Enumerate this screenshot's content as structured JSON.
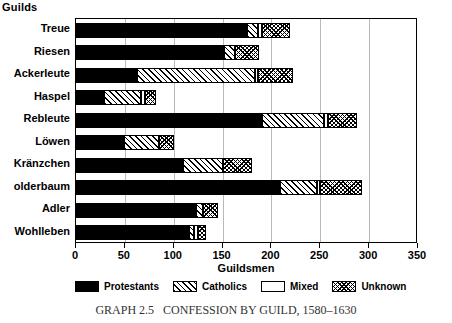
{
  "figure": {
    "corner_title": "Guilds",
    "caption": "GRAPH 2.5   CONFESSION BY GUILD, 1580–1630"
  },
  "legend": {
    "items": [
      {
        "label": "Protestants",
        "key": "protestants",
        "pattern": "solid-black"
      },
      {
        "label": "Catholics",
        "key": "catholics",
        "pattern": "diagonal-hatch"
      },
      {
        "label": "Mixed",
        "key": "mixed",
        "pattern": "white-empty"
      },
      {
        "label": "Unknown",
        "key": "unknown",
        "pattern": "cross-hatch"
      }
    ]
  },
  "chart_data": {
    "type": "bar",
    "orientation": "horizontal",
    "stacked": true,
    "title": "GRAPH 2.5   CONFESSION BY GUILD, 1580–1630",
    "xlabel": "Guildsmen",
    "ylabel": "Guilds",
    "xlim": [
      0,
      350
    ],
    "xticks": [
      0,
      50,
      100,
      150,
      200,
      250,
      300,
      350
    ],
    "grid": "vertical",
    "legend_position": "bottom",
    "categories": [
      "Treue",
      "Riesen",
      "Ackerleute",
      "Haspel",
      "Rebleute",
      "Löwen",
      "Kränzchen",
      "olderbaum",
      "Adler",
      "Wohlleben"
    ],
    "series": [
      {
        "name": "Protestants",
        "values": [
          175,
          151,
          62,
          29,
          190,
          49,
          109,
          209,
          123,
          116
        ]
      },
      {
        "name": "Catholics",
        "values": [
          11,
          12,
          121,
          38,
          64,
          36,
          41,
          38,
          7,
          5
        ]
      },
      {
        "name": "Mixed",
        "values": [
          4,
          0,
          3,
          4,
          4,
          0,
          0,
          3,
          0,
          4
        ]
      },
      {
        "name": "Unknown",
        "values": [
          29,
          24,
          36,
          11,
          30,
          15,
          30,
          43,
          15,
          8
        ]
      }
    ],
    "totals": [
      219,
      187,
      222,
      82,
      288,
      100,
      180,
      293,
      145,
      133
    ]
  }
}
